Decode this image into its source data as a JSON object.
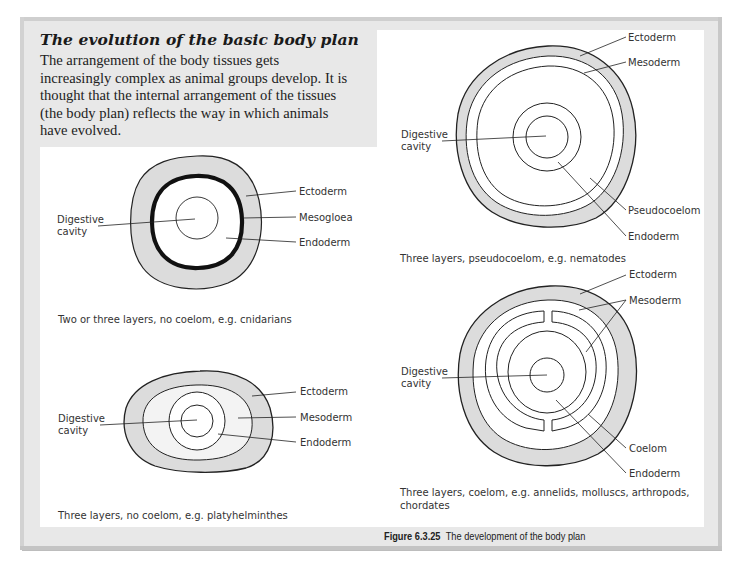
{
  "header": {
    "title": "The evolution of the basic body plan",
    "intro_lines": [
      "The arrangement of the body tissues gets",
      "increasingly complex as animal groups develop. It is",
      "thought that the internal arrangement of the tissues",
      "(the body plan) reflects the way in which animals",
      "have evolved."
    ]
  },
  "diagrams": [
    {
      "id": "cnidarians",
      "caption": "Two or three layers, no coelom, e.g. cnidarians",
      "labels": {
        "left": [
          "Digestive",
          "cavity"
        ],
        "right": [
          "Ectoderm",
          "Mesogloea",
          "Endoderm"
        ]
      }
    },
    {
      "id": "platyhelminthes",
      "caption": "Three layers, no coelom, e.g. platyhelminthes",
      "labels": {
        "left": [
          "Digestive",
          "cavity"
        ],
        "right": [
          "Ectoderm",
          "Mesoderm",
          "Endoderm"
        ]
      }
    },
    {
      "id": "nematodes",
      "caption": "Three layers, pseudocoelom, e.g. nematodes",
      "labels": {
        "left": [
          "Digestive",
          "cavity"
        ],
        "right": [
          "Ectoderm",
          "Mesoderm",
          "Pseudocoelom",
          "Endoderm"
        ]
      }
    },
    {
      "id": "coelomates",
      "caption_lines": [
        "Three layers, coelom, e.g. annelids, molluscs, arthropods,",
        "chordates"
      ],
      "labels": {
        "left": [
          "Digestive",
          "cavity"
        ],
        "right": [
          "Ectoderm",
          "Mesoderm",
          "Coelom",
          "Endoderm"
        ]
      }
    }
  ],
  "figure": {
    "number": "Figure 6.3.25",
    "title": "The development of the body plan"
  },
  "colors": {
    "frame": "#e8e8e8",
    "panel": "#ffffff",
    "ectoderm_fill": "#dcdcdc",
    "mesoderm_fill": "#f2f2f2",
    "line": "#222222"
  }
}
